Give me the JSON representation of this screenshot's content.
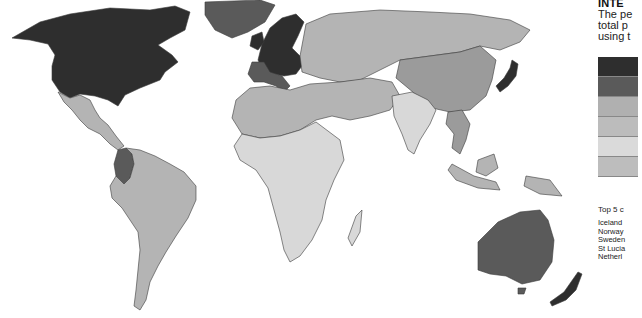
{
  "panel": {
    "title": "INTE",
    "subtitle_lines": [
      "The pe",
      "total p",
      "using t"
    ],
    "legend": {
      "classes": [
        {
          "label": "",
          "color": "#2e2e2e"
        },
        {
          "label": "",
          "color": "#5a5a5a"
        },
        {
          "label": "",
          "color": "#9b9b9b"
        },
        {
          "label": "",
          "color": "#b4b4b4"
        },
        {
          "label": "",
          "color": "#d8d8d8"
        },
        {
          "label": "",
          "color": "#bdbdbd"
        }
      ]
    },
    "top5": {
      "title": "Top 5 c",
      "items": [
        "Iceland",
        "Norway",
        "Sweden",
        "St Lucia",
        "Netherl"
      ]
    }
  },
  "map": {
    "regions": [
      {
        "name": "north-america",
        "class": 0
      },
      {
        "name": "greenland",
        "class": 1
      },
      {
        "name": "mexico-central-america",
        "class": 3
      },
      {
        "name": "colombia",
        "class": 1
      },
      {
        "name": "south-america",
        "class": 3
      },
      {
        "name": "western-europe",
        "class": 0
      },
      {
        "name": "southern-europe",
        "class": 1
      },
      {
        "name": "russia-central-asia",
        "class": 3
      },
      {
        "name": "china",
        "class": 3
      },
      {
        "name": "north-africa-middle-east",
        "class": 3
      },
      {
        "name": "sub-saharan-africa",
        "class": 4
      },
      {
        "name": "india",
        "class": 4
      },
      {
        "name": "southeast-asia",
        "class": 3
      },
      {
        "name": "japan",
        "class": 0
      },
      {
        "name": "australia",
        "class": 1
      },
      {
        "name": "new-zealand",
        "class": 0
      }
    ]
  }
}
